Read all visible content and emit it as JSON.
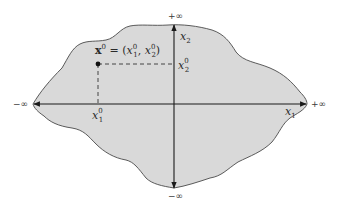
{
  "diagram": {
    "region": {
      "fill": "#d9d9d9",
      "stroke": "#4a4a4a",
      "description": "irregular blob representing the full plane region"
    },
    "axes": {
      "horizontal": {
        "label": "x",
        "label_sub": "1",
        "neg_end": "−∞",
        "pos_end": "+∞"
      },
      "vertical": {
        "label": "x",
        "label_sub": "2",
        "neg_end": "−∞",
        "pos_end": "+∞"
      }
    },
    "point": {
      "name": "x",
      "name_sup": "0",
      "equals": " = (",
      "comp1": "x",
      "comp1_sub": "1",
      "comp1_sup": "0",
      "comma": ", ",
      "comp2": "x",
      "comp2_sub": "2",
      "comp2_sup": "0",
      "close": ")"
    },
    "projections": {
      "x1": {
        "base": "x",
        "sub": "1",
        "sup": "0"
      },
      "x2": {
        "base": "x",
        "sub": "2",
        "sup": "0"
      }
    },
    "colors": {
      "axis": "#1a1a1a",
      "dash": "#333333",
      "point": "#111111"
    }
  }
}
